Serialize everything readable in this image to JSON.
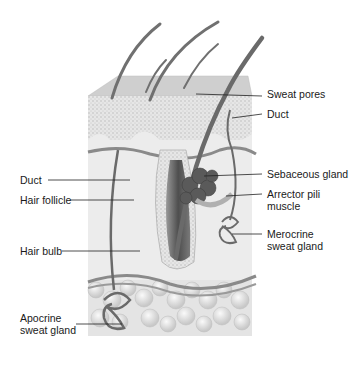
{
  "diagram": {
    "labels_right": [
      {
        "id": "sweat-pores",
        "text": "Sweat pores",
        "x": 267,
        "y": 92
      },
      {
        "id": "duct-right",
        "text": "Duct",
        "x": 267,
        "y": 111
      },
      {
        "id": "sebaceous-gland",
        "text": "Sebaceous gland",
        "x": 267,
        "y": 170
      },
      {
        "id": "arrector-pili",
        "text": "Arrector pili\nmuscle",
        "x": 267,
        "y": 190
      },
      {
        "id": "merocrine-gland",
        "text": "Merocrine\nsweat gland",
        "x": 267,
        "y": 230
      }
    ],
    "labels_left": [
      {
        "id": "duct-left",
        "text": "Duct",
        "x": 20,
        "y": 176
      },
      {
        "id": "hair-follicle",
        "text": "Hair follicle",
        "x": 20,
        "y": 196
      },
      {
        "id": "hair-bulb",
        "text": "Hair bulb",
        "x": 20,
        "y": 247
      },
      {
        "id": "apocrine-gland",
        "text": "Apocrine\nsweat gland",
        "x": 20,
        "y": 314
      }
    ],
    "colors": {
      "epidermis": "#d8d8d8",
      "dermis": "#ececec",
      "hypodermis": "#e2e2e2",
      "hair": "#6e6e6e",
      "gland": "#555555",
      "leader": "#222222"
    }
  }
}
